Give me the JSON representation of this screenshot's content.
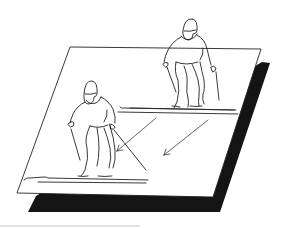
{
  "illustration": {
    "subject": "two skiers descending a slope on a tilted plane with arrows indicating direction",
    "colors": {
      "background": "#ffffff",
      "ink": "#222222",
      "shadow": "#141414",
      "plane": "#ffffff",
      "baseline": "#c8c8c8"
    },
    "elements": {
      "plane": "white parallelogram slope",
      "shadow": "black drop shadow",
      "skier_upper": "skier in upper right",
      "skier_lower": "skier in lower left",
      "arrows": 2
    }
  }
}
